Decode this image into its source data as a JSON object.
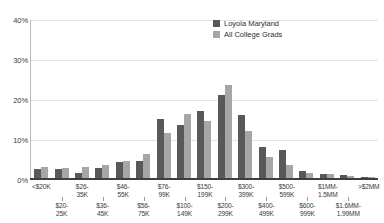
{
  "chart_data": {
    "type": "bar",
    "title": "",
    "xlabel": "",
    "ylabel": "",
    "ylim": [
      0,
      40
    ],
    "yticks": [
      "0%",
      "10%",
      "20%",
      "30%",
      "40%"
    ],
    "ytick_values": [
      0,
      10,
      20,
      30,
      40
    ],
    "grid": true,
    "legend_position": "top-right",
    "categories": [
      "<$20K",
      "$20-25K",
      "$26-35K",
      "$36-45K",
      "$46-55K",
      "$56-75K",
      "$76-99K",
      "$100-149K",
      "$150-199K",
      "$200-299K",
      "$300-399K",
      "$400-499K",
      "$500-599K",
      "$600-999K",
      "$1MM-1.5MM",
      "$1.6MM-1.99MM",
      ">$2MM"
    ],
    "series": [
      {
        "name": "Loyola Maryland",
        "color": "#595959",
        "values": [
          2.4,
          2.2,
          1.2,
          2.6,
          4.0,
          4.2,
          15.0,
          13.5,
          17.0,
          21.0,
          16.0,
          7.8,
          7.2,
          1.8,
          1.0,
          0.7,
          0.3
        ]
      },
      {
        "name": "All College Grads",
        "color": "#a6a6a6",
        "values": [
          2.9,
          2.6,
          2.8,
          3.4,
          4.4,
          6.2,
          11.4,
          16.2,
          14.5,
          23.5,
          12.0,
          5.3,
          3.4,
          1.2,
          1.0,
          0.5,
          0.2
        ]
      }
    ]
  },
  "legend": {
    "items": [
      {
        "label": "Loyola Maryland",
        "color": "#595959"
      },
      {
        "label": "All College Grads",
        "color": "#a6a6a6"
      }
    ]
  },
  "axis_labels": {
    "top_row": [
      "<$20K",
      "$26-",
      "35K",
      "$46-",
      "55K",
      "$76-",
      "99K",
      "$150-",
      "199K",
      "$300-",
      "399K",
      "$500-",
      "599K",
      "$1MM-",
      "1.5MM",
      ">$2MM"
    ],
    "bottom_row": [
      "$20-",
      "25K",
      "$36-",
      "45K",
      "$56-",
      "75K",
      "$100-",
      "149K",
      "$200-",
      "299K",
      "$400-",
      "499K",
      "$600-",
      "999K",
      "$1.6MM-",
      "1.99MM"
    ],
    "top_labels": [
      "<$20K",
      "$26-\n35K",
      "$46-\n55K",
      "$76-\n99K",
      "$150-\n199K",
      "$300-\n399K",
      "$500-\n599K",
      "$1MM-\n1.5MM",
      ">$2MM"
    ],
    "bottom_labels": [
      "$20-\n25K",
      "$36-\n45K",
      "$56-\n75K",
      "$100-\n149K",
      "$200-\n299K",
      "$400-\n499K",
      "$600-\n999K",
      "$1.6MM-\n1.99MM"
    ]
  },
  "colors": {
    "series_a": "#595959",
    "series_b": "#a6a6a6",
    "grid": "#e3e3e3",
    "axis": "#3f3f3f",
    "text": "#3b3b3b",
    "background": "#ffffff"
  }
}
